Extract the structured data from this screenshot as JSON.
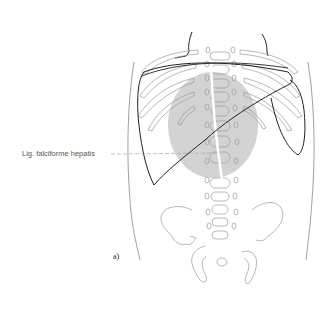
{
  "figure": {
    "panel_label": "a)",
    "annotations": [
      {
        "text": "Lig. falciforme hepatis",
        "target": "falciform ligament"
      }
    ],
    "colors": {
      "outline": "#888888",
      "liver_outline": "#222222",
      "shaded_region": "#d3d3d3",
      "leader_line": "#999999",
      "background": "#ffffff"
    },
    "structures": [
      "torso outline",
      "rib cage",
      "vertebral column",
      "liver",
      "pelvis",
      "shaded midline region",
      "falciform ligament"
    ]
  }
}
